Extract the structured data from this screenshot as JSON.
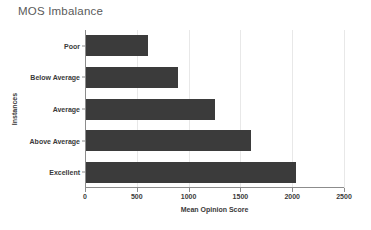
{
  "chart_data": {
    "type": "bar",
    "orientation": "horizontal",
    "title": "MOS Imbalance",
    "xlabel": "Mean Opinion Score",
    "ylabel": "Instances",
    "categories": [
      "Poor",
      "Below Average",
      "Average",
      "Above Average",
      "Excellent"
    ],
    "values": [
      610,
      900,
      1250,
      1600,
      2040
    ],
    "series": [
      {
        "name": "Instances",
        "values": [
          610,
          900,
          1250,
          1600,
          2040
        ]
      }
    ],
    "xlim": [
      0,
      2500
    ],
    "xticks": [
      0,
      500,
      1000,
      1500,
      2000,
      2500
    ],
    "xtick_labels": [
      "0",
      "500",
      "1000",
      "1500",
      "2000",
      "2500"
    ],
    "grid": true,
    "grid_axis": "x",
    "legend": false,
    "bar_color": "#3b3b3b",
    "title_color": "#5a5a5a",
    "axis_color": "#8c8c8c",
    "grid_color": "#e8e8e8",
    "background": "#ffffff"
  }
}
